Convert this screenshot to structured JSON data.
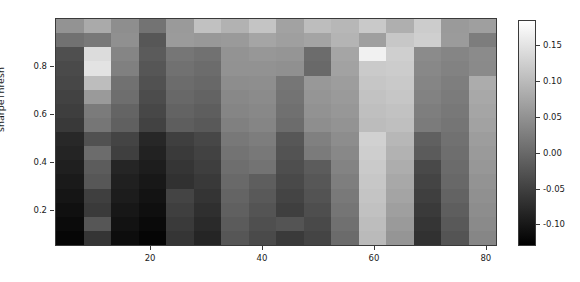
{
  "chart_data": {
    "type": "heatmap",
    "title": "",
    "xlabel": "",
    "ylabel": "sharpeThresh",
    "colormap": "grayscale",
    "grid": false,
    "legend_position": "right-colorbar",
    "xlim": [
      3,
      82
    ],
    "ylim": [
      0.05,
      1.0
    ],
    "x_ticks": [
      20,
      40,
      60,
      80
    ],
    "x_tick_labels": [
      "20",
      "40",
      "60",
      "80"
    ],
    "y_ticks": [
      0.2,
      0.4,
      0.6,
      0.8
    ],
    "y_tick_labels": [
      "0.2",
      "0.4",
      "0.6",
      "0.8"
    ],
    "colorbar": {
      "vmin": -0.13,
      "vmax": 0.185,
      "ticks": [
        -0.1,
        -0.05,
        0.0,
        0.05,
        0.1,
        0.15
      ],
      "tick_labels": [
        "-0.10",
        "-0.05",
        "0.00",
        "0.05",
        "0.10",
        "0.15"
      ],
      "low_color": "#000000",
      "high_color": "#ffffff"
    },
    "n_cols": 16,
    "n_rows": 16,
    "x_centers": [
      5.5,
      10.4,
      15.3,
      20.3,
      25.2,
      30.1,
      35.0,
      40.0,
      44.9,
      49.8,
      54.7,
      59.7,
      64.6,
      69.5,
      74.4,
      79.4
    ],
    "y_centers": [
      0.97,
      0.91,
      0.85,
      0.79,
      0.73,
      0.67,
      0.61,
      0.55,
      0.49,
      0.43,
      0.37,
      0.31,
      0.25,
      0.19,
      0.13,
      0.07
    ],
    "values": [
      [
        0.052,
        0.08,
        0.046,
        0.012,
        0.06,
        0.108,
        0.09,
        0.112,
        0.07,
        0.104,
        0.096,
        0.118,
        0.086,
        0.122,
        0.06,
        0.066
      ],
      [
        0.01,
        0.018,
        0.048,
        -0.022,
        0.062,
        0.058,
        0.06,
        0.074,
        0.066,
        0.072,
        0.092,
        0.066,
        0.116,
        0.126,
        0.062,
        0.024
      ],
      [
        -0.032,
        0.142,
        0.034,
        -0.018,
        0.016,
        0.01,
        0.052,
        0.056,
        0.054,
        0.004,
        0.074,
        0.168,
        0.126,
        0.042,
        0.034,
        0.042
      ],
      [
        -0.038,
        0.15,
        0.028,
        -0.024,
        0.01,
        0.004,
        0.05,
        0.05,
        0.048,
        0.0,
        0.07,
        0.12,
        0.122,
        0.038,
        0.03,
        0.04
      ],
      [
        -0.042,
        0.104,
        0.01,
        -0.03,
        0.004,
        -0.002,
        0.044,
        0.046,
        0.016,
        0.058,
        0.064,
        0.114,
        0.118,
        0.034,
        0.026,
        0.082
      ],
      [
        -0.048,
        0.06,
        0.006,
        -0.036,
        -0.002,
        -0.008,
        0.038,
        0.042,
        0.012,
        0.054,
        0.06,
        0.11,
        0.114,
        0.03,
        0.022,
        0.078
      ],
      [
        -0.054,
        0.022,
        -0.006,
        -0.042,
        -0.008,
        -0.014,
        0.034,
        0.038,
        0.008,
        0.05,
        0.056,
        0.106,
        0.11,
        0.026,
        0.018,
        0.074
      ],
      [
        -0.06,
        0.016,
        -0.012,
        -0.048,
        -0.014,
        -0.02,
        0.028,
        0.034,
        0.004,
        0.046,
        0.052,
        0.102,
        0.106,
        0.022,
        0.014,
        0.07
      ],
      [
        -0.08,
        -0.03,
        -0.046,
        -0.082,
        -0.052,
        -0.042,
        0.018,
        0.024,
        -0.022,
        0.028,
        0.044,
        0.128,
        0.096,
        -0.012,
        0.01,
        0.064
      ],
      [
        -0.086,
        0.004,
        -0.052,
        -0.088,
        -0.058,
        -0.048,
        0.012,
        0.018,
        -0.028,
        0.022,
        0.038,
        0.124,
        0.09,
        -0.018,
        0.006,
        0.06
      ],
      [
        -0.092,
        -0.016,
        -0.084,
        -0.094,
        -0.064,
        -0.054,
        0.006,
        0.012,
        -0.034,
        -0.016,
        0.032,
        0.12,
        0.084,
        -0.04,
        0.002,
        0.056
      ],
      [
        -0.098,
        -0.022,
        -0.09,
        -0.1,
        -0.07,
        -0.06,
        0.0,
        -0.014,
        -0.04,
        -0.022,
        0.026,
        0.116,
        0.078,
        -0.046,
        -0.002,
        0.052
      ],
      [
        -0.104,
        -0.052,
        -0.096,
        -0.106,
        -0.046,
        -0.066,
        -0.006,
        -0.02,
        -0.046,
        -0.028,
        0.02,
        0.112,
        0.072,
        -0.052,
        -0.008,
        0.048
      ],
      [
        -0.11,
        -0.058,
        -0.102,
        -0.112,
        -0.052,
        -0.072,
        -0.012,
        -0.026,
        -0.052,
        -0.034,
        0.014,
        0.108,
        0.066,
        -0.058,
        -0.014,
        0.044
      ],
      [
        -0.116,
        -0.024,
        -0.108,
        -0.118,
        -0.058,
        -0.078,
        -0.018,
        -0.032,
        -0.026,
        -0.04,
        0.008,
        0.104,
        0.06,
        -0.064,
        -0.02,
        0.04
      ],
      [
        -0.122,
        -0.064,
        -0.114,
        -0.124,
        -0.064,
        -0.084,
        -0.024,
        -0.038,
        -0.058,
        -0.046,
        0.002,
        0.1,
        0.054,
        -0.07,
        -0.026,
        0.036
      ]
    ]
  }
}
